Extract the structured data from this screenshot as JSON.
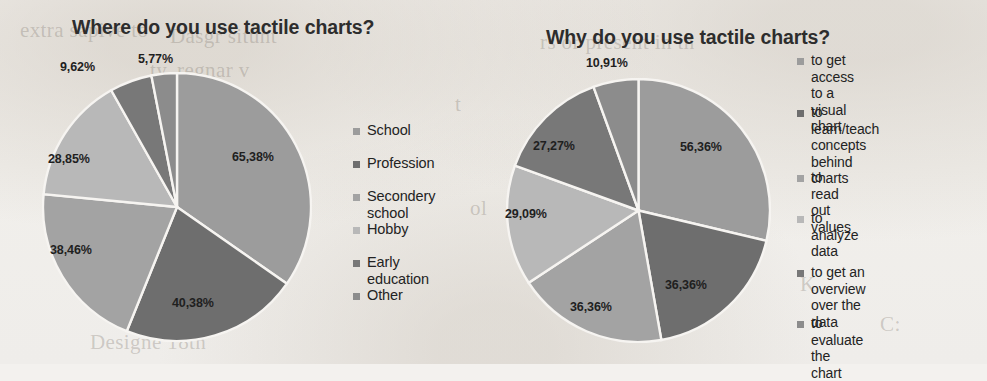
{
  "charts": [
    {
      "id": "where-chart",
      "title": "Where do you use tactile charts?",
      "labels": [
        "65,38%",
        "40,38%",
        "38,46%",
        "28,85%",
        "9,62%",
        "5,77%"
      ],
      "legend": [
        {
          "label": "School",
          "color": "#9c9c9c"
        },
        {
          "label": "Profession",
          "color": "#6e6e6e"
        },
        {
          "label": "Secondery school",
          "color": "#a3a3a3"
        },
        {
          "label": "Hobby",
          "color": "#b8b8b8"
        },
        {
          "label": "Early education",
          "color": "#787878"
        },
        {
          "label": "Other",
          "color": "#8c8c8c"
        }
      ]
    },
    {
      "id": "why-chart",
      "title": "Why do you use tactile charts?",
      "labels": [
        "56,36%",
        "36,36%",
        "36,36%",
        "29,09%",
        "27,27%",
        "10,91%"
      ],
      "legend": [
        {
          "label": "to get access to a\nvisual chart",
          "color": "#9c9c9c"
        },
        {
          "label": "to learn/teach\nconcepts behind\ncharts",
          "color": "#6e6e6e"
        },
        {
          "label": "to read out values",
          "color": "#a3a3a3"
        },
        {
          "label": "to analyze data",
          "color": "#b8b8b8"
        },
        {
          "label": "to get an overview\nover the data",
          "color": "#787878"
        },
        {
          "label": "to evaluate the chart",
          "color": "#8c8c8c"
        }
      ]
    }
  ],
  "background_ghost_text": [
    "Dasgr situnt",
    "ty, regnar v",
    "extra sapive to",
    "rs or present in th",
    "ol",
    "t",
    "K",
    "Designe 18th",
    "C:",
    "to"
  ],
  "chart_data": [
    {
      "type": "pie",
      "title": "Where do you use tactile charts?",
      "categories": [
        "School",
        "Profession",
        "Secondery school",
        "Hobby",
        "Early education",
        "Other"
      ],
      "values": [
        65.38,
        40.38,
        38.46,
        28.85,
        9.62,
        5.77
      ],
      "value_labels": [
        "65,38%",
        "40,38%",
        "38,46%",
        "28,85%",
        "9,62%",
        "5,77%"
      ],
      "colors": [
        "#9c9c9c",
        "#6e6e6e",
        "#a3a3a3",
        "#b8b8b8",
        "#787878",
        "#8c8c8c"
      ],
      "legend_position": "right",
      "start_angle_deg": 0,
      "direction": "clockwise",
      "note": "multi-select survey: percentages sum to more than 100%",
      "xlabel": "",
      "ylabel": ""
    },
    {
      "type": "pie",
      "title": "Why do you use tactile charts?",
      "categories": [
        "to get access to a visual chart",
        "to learn/teach concepts behind charts",
        "to read out values",
        "to analyze data",
        "to get an overview over the data",
        "to evaluate the chart"
      ],
      "values": [
        56.36,
        36.36,
        36.36,
        29.09,
        27.27,
        10.91
      ],
      "value_labels": [
        "56,36%",
        "36,36%",
        "36,36%",
        "29,09%",
        "27,27%",
        "10,91%"
      ],
      "colors": [
        "#9c9c9c",
        "#6e6e6e",
        "#a3a3a3",
        "#b8b8b8",
        "#787878",
        "#8c8c8c"
      ],
      "legend_position": "right",
      "start_angle_deg": 0,
      "direction": "clockwise",
      "note": "multi-select survey: percentages sum to more than 100%",
      "xlabel": "",
      "ylabel": ""
    }
  ]
}
